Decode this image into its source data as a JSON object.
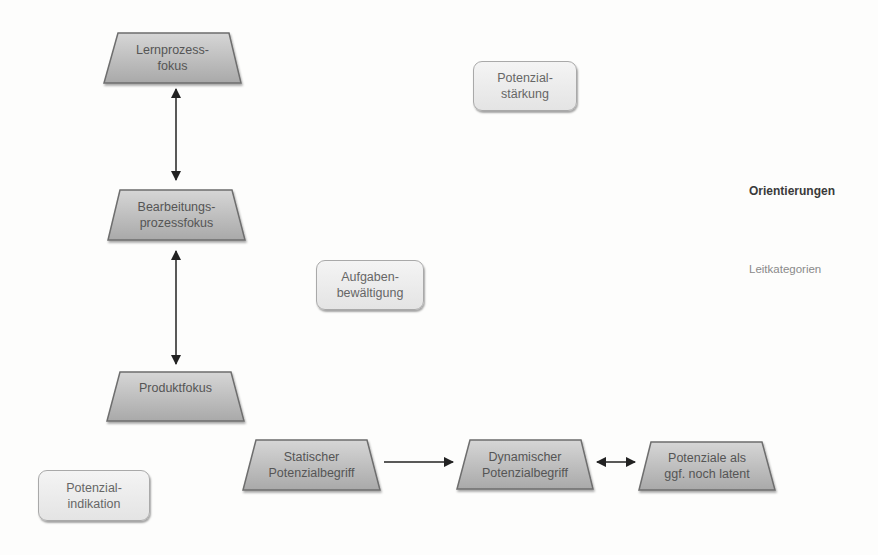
{
  "diagram": {
    "colors": {
      "trapezoid_fill_top": "#d8d8d8",
      "trapezoid_fill_bottom": "#a8a8a8",
      "trapezoid_stroke": "#6e6e6e",
      "rounded_box_fill": "#ececec",
      "rounded_box_stroke": "#a9a9a9",
      "arrow": "#222222",
      "text": "#555555"
    },
    "orientations": [
      {
        "id": "lernprozessfokus",
        "label": "Lernprozess-\nfokus"
      },
      {
        "id": "bearbeitungsprozessfokus",
        "label": "Bearbeitungs-\nprozessfokus"
      },
      {
        "id": "produktfokus",
        "label": "Produktfokus"
      },
      {
        "id": "statischer-potenzialbegriff",
        "label": "Statischer\nPotenzialbegriff"
      },
      {
        "id": "dynamischer-potenzialbegriff",
        "label": "Dynamischer\nPotenzialbegriff"
      },
      {
        "id": "potenziale-latent",
        "label": "Potenziale als\nggf. noch latent"
      }
    ],
    "lead_categories": [
      {
        "id": "potenzialstaerkung",
        "label": "Potenzial-\nstärkung"
      },
      {
        "id": "aufgabenbewaeltigung",
        "label": "Aufgaben-\nbewältigung"
      },
      {
        "id": "potenzialindikation",
        "label": "Potenzial-\nindikation"
      }
    ],
    "connections": [
      {
        "from": "lernprozessfokus",
        "to": "bearbeitungsprozessfokus",
        "type": "bidirectional"
      },
      {
        "from": "bearbeitungsprozessfokus",
        "to": "produktfokus",
        "type": "bidirectional"
      },
      {
        "from": "statischer-potenzialbegriff",
        "to": "dynamischer-potenzialbegriff",
        "type": "directed"
      },
      {
        "from": "dynamischer-potenzialbegriff",
        "to": "potenziale-latent",
        "type": "bidirectional"
      }
    ],
    "legend": {
      "orientations_label": "Orientierungen",
      "lead_categories_label": "Leitkategorien"
    }
  }
}
